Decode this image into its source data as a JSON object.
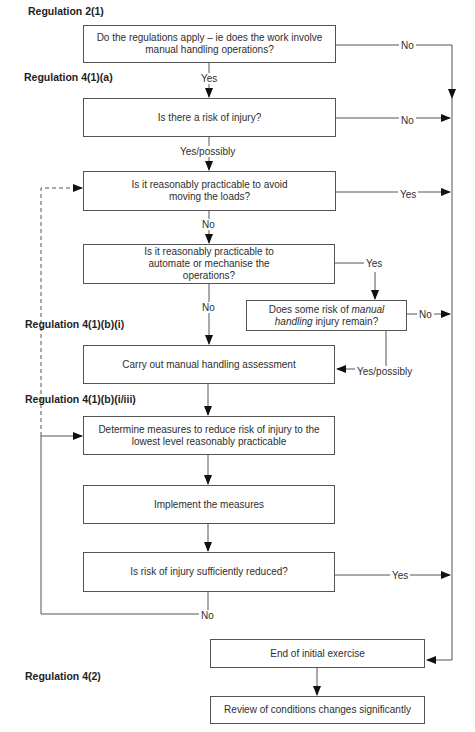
{
  "regulations": {
    "r2_1": "Regulation 2(1)",
    "r4_1_a": "Regulation 4(1)(a)",
    "r4_1_b_i": "Regulation 4(1)(b)(i)",
    "r4_1_b_iii": "Regulation 4(1)(b)(i/iii)",
    "r4_2": "Regulation 4(2)"
  },
  "boxes": {
    "apply": "Do the regulations apply – ie does the work involve manual handling operations?",
    "risk": "Is there a risk of injury?",
    "avoid": "Is it reasonably practicable to avoid moving the loads?",
    "automate": "Is it reasonably practicable to automate or mechanise the operations?",
    "remain_pre": "Does some risk of ",
    "remain_italic": "manual handling",
    "remain_post": " injury remain?",
    "assess": "Carry out manual handling assessment",
    "determine": "Determine measures to reduce risk of injury to the lowest level reasonably practicable",
    "implement": "Implement the measures",
    "reduced": "Is risk of injury sufficiently reduced?",
    "end": "End of initial exercise",
    "review": "Review of conditions changes significantly"
  },
  "labels": {
    "apply_no": "No",
    "apply_yes": "Yes",
    "risk_no": "No",
    "risk_yes": "Yes/possibly",
    "avoid_yes": "Yes",
    "avoid_no": "No",
    "automate_yes": "Yes",
    "automate_no": "No",
    "remain_no": "No",
    "remain_yes": "Yes/possibly",
    "reduced_yes": "Yes",
    "reduced_no": "No"
  }
}
